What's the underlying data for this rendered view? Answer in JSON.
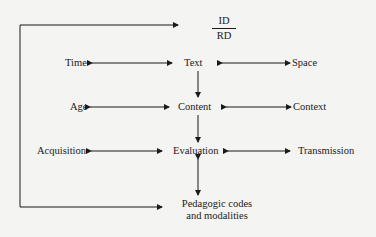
{
  "diagram": {
    "top": {
      "numerator": "ID",
      "denominator": "RD"
    },
    "row1": {
      "left": "Time",
      "center": "Text",
      "right": "Space"
    },
    "row2": {
      "left": "Age",
      "center": "Content",
      "right": "Context"
    },
    "row3": {
      "left": "Acquisition",
      "center": "Evaluation",
      "right": "Transmission"
    },
    "bottom": {
      "line1": "Pedagogic codes",
      "line2": "and modalities"
    }
  },
  "colors": {
    "line": "#1a1a1a",
    "background": "#f4f4f2"
  }
}
